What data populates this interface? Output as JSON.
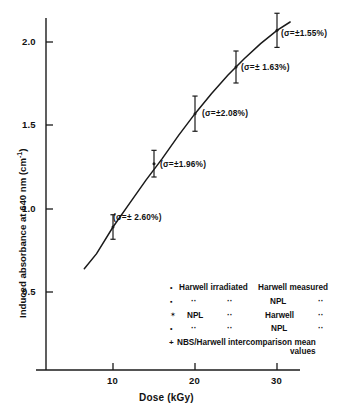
{
  "chart_data": {
    "type": "line",
    "title": "",
    "xlabel": "Dose (kGy)",
    "ylabel": "Induced absorbance at 640 nm (cm⁻¹)",
    "ylabel_main": "Induced absorbance at 640 nm (cm",
    "ylabel_sup": "-1",
    "ylabel_tail": ")",
    "xlim": [
      0,
      33
    ],
    "ylim": [
      0.22,
      2.22
    ],
    "xticks": [
      10,
      20,
      30
    ],
    "xtick_labels": [
      "10",
      "20",
      "30"
    ],
    "yticks": [
      0.5,
      1.0,
      1.5,
      2.0
    ],
    "ytick_labels": [
      "0.5",
      "1.0",
      "1.5",
      "2.0"
    ],
    "grid": false,
    "legend_position": "inside-lower-right",
    "curve": {
      "name": "fitted dose-response curve",
      "x": [
        6.5,
        8,
        10,
        12,
        14,
        16,
        18,
        20,
        22,
        24,
        26,
        28,
        30,
        31.6
      ],
      "y": [
        0.64,
        0.73,
        0.89,
        1.03,
        1.17,
        1.3,
        1.44,
        1.57,
        1.69,
        1.8,
        1.9,
        1.99,
        2.07,
        2.12
      ]
    },
    "series": [
      {
        "name": "measured points with standard deviation",
        "x": [
          10,
          15,
          20,
          25,
          30
        ],
        "y": [
          0.89,
          1.27,
          1.57,
          1.85,
          2.07
        ],
        "yerr_percent": [
          2.6,
          1.96,
          2.08,
          1.63,
          1.55
        ],
        "yerr": [
          0.023,
          0.025,
          0.033,
          0.03,
          0.032
        ]
      }
    ],
    "annotations": [
      {
        "text": "(σ=± 2.60%)",
        "x": 10,
        "y": 0.89
      },
      {
        "text": "(σ=±1.96%)",
        "x": 15,
        "y": 1.27
      },
      {
        "text": "(σ=±2.08%)",
        "x": 20,
        "y": 1.57
      },
      {
        "text": "(σ=± 1.63%)",
        "x": 25,
        "y": 1.85
      },
      {
        "text": "(σ=±1.55%)",
        "x": 30,
        "y": 2.07
      }
    ]
  },
  "axes": {
    "x_title": "Dose (kGy)",
    "x_tick_1": "10",
    "x_tick_2": "20",
    "x_tick_3": "30",
    "y_tick_1": "0.5",
    "y_tick_2": "1.0",
    "y_tick_3": "1.5",
    "y_tick_4": "2.0",
    "y_title_main": "Induced absorbance at 640 nm (cm",
    "y_title_sup": "-1",
    "y_title_tail": ")"
  },
  "annotations": {
    "sigma_1": "(σ=± 2.60%)",
    "sigma_2": "(σ=±1.96%)",
    "sigma_3": "(σ=±2.08%)",
    "sigma_4": "(σ=± 1.63%)",
    "sigma_5": "(σ=±1.55%)"
  },
  "legend": {
    "rows": [
      {
        "marker": "filled-circle-marker",
        "col1": "Harwell irradiated",
        "col2": "Harwell measured",
        "col3": ""
      },
      {
        "marker": "filled-square-marker",
        "col1": "··",
        "col2": "NPL",
        "col3": "··"
      },
      {
        "marker": "asterisk-marker",
        "col1": "NPL",
        "col2_mid": "··",
        "col2": "Harwell",
        "col3": "··"
      },
      {
        "marker": "small-dot-marker",
        "col1": "··",
        "col2_mid": "··",
        "col2": "NPL",
        "col3": "··"
      },
      {
        "marker": "plus-marker",
        "col1": "NBS/Harwell intercomparison mean",
        "col2": "values",
        "col3": ""
      }
    ],
    "row1_marker": "•",
    "row1_text_a": "Harwell irradiated",
    "row1_text_b": "Harwell measured",
    "row2_marker": "▪",
    "row2_text_a": "··",
    "row2_text_b": "··",
    "row2_text_c": "NPL",
    "row2_text_d": "··",
    "row3_marker": "✶",
    "row3_text_a": "NPL",
    "row3_text_b": "··",
    "row3_text_c": "Harwell",
    "row3_text_d": "··",
    "row4_marker": "•",
    "row4_text_a": "··",
    "row4_text_b": "··",
    "row4_text_c": "NPL",
    "row4_text_d": "··",
    "row5_marker": "+",
    "row5_text_a": "NBS/Harwell intercomparison mean",
    "row5_text_b": "values"
  },
  "colors": {
    "axis": "#1a1a1a",
    "curve": "#1a1a1a",
    "text": "#111111",
    "background": "#ffffff"
  }
}
